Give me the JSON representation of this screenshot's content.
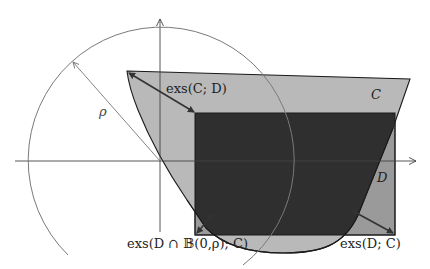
{
  "diagram": {
    "colors": {
      "background": "#ffffff",
      "set_C_fill": "#b9b9b9",
      "set_D_fill": "#9a9a9a",
      "intersection_fill": "#2f2f2f",
      "outline": "#1a1a1a",
      "axis": "#444444",
      "circle": "#7a7a7a",
      "arrow": "#333333"
    },
    "axes": {
      "origin": [
        160,
        161
      ],
      "x_axis_label": "",
      "y_axis_label": ""
    },
    "circle": {
      "center": [
        160,
        161
      ],
      "radius": 133,
      "label": "ρ"
    },
    "sets": [
      {
        "name": "C",
        "label": "C"
      },
      {
        "name": "D",
        "label": "D"
      }
    ],
    "labels": {
      "rho": "ρ",
      "set_C": "C",
      "set_D": "D",
      "exs_C_D": "exs(C; D)",
      "exs_D_ball_C": "exs(D ∩ 𝔹(0,ρ); C)",
      "exs_D_C": "exs(D; C)"
    }
  }
}
